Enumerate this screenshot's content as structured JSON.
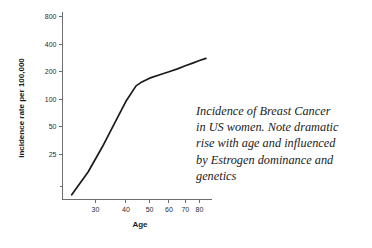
{
  "caption": {
    "lines": [
      "Incidence of Breast Cancer",
      "in US women. Note dramatic",
      "rise with age and influenced",
      "by Estrogen dominance and",
      "genetics"
    ]
  },
  "colors": {
    "background": "#ffffff",
    "curve": "#1a1a1a",
    "axis": "#6e6e6e",
    "text": "#1b1b1b"
  },
  "chart_data": {
    "type": "line",
    "title": "",
    "xlabel": "Age",
    "ylabel": "Incidence rate per 100,000",
    "xscale": "log",
    "yscale": "log",
    "xlim": [
      22,
      90
    ],
    "ylim": [
      8,
      900
    ],
    "grid": false,
    "legend": null,
    "xticks": [
      30,
      40,
      50,
      60,
      70,
      80
    ],
    "xticklabels": [
      "30",
      "40",
      "50",
      "60",
      "70",
      "80"
    ],
    "yticks": [
      25,
      50,
      100,
      200,
      400,
      800
    ],
    "yticklabels": [
      "25",
      "50",
      "100",
      "200",
      "400",
      "800"
    ],
    "series": [
      {
        "name": "Breast cancer incidence",
        "x": [
          24,
          28,
          32,
          36,
          40,
          44,
          46,
          50,
          55,
          60,
          65,
          70,
          75,
          80,
          85
        ],
        "y": [
          9,
          16,
          30,
          55,
          95,
          140,
          152,
          170,
          185,
          200,
          215,
          232,
          248,
          265,
          280
        ]
      }
    ]
  }
}
